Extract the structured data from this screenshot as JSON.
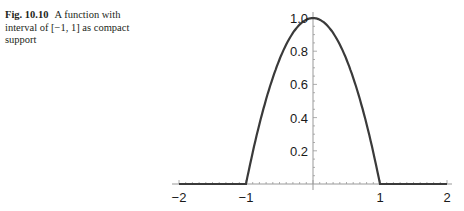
{
  "caption": {
    "label": "Fig. 10.10",
    "text": "A function with interval of [−1, 1] as compact support"
  },
  "chart_data": {
    "type": "line",
    "title": "",
    "xlabel": "",
    "ylabel": "",
    "xlim": [
      -2,
      2
    ],
    "ylim": [
      0,
      1.0
    ],
    "grid": false,
    "x_ticks": [
      "−2",
      "−1",
      "1",
      "2"
    ],
    "y_ticks": [
      "0.2",
      "0.4",
      "0.6",
      "0.8",
      "1.0"
    ],
    "series": [
      {
        "name": "f(x)",
        "x": [
          -2,
          -1,
          -0.75,
          -0.5,
          -0.25,
          0,
          0.25,
          0.5,
          0.75,
          1,
          2
        ],
        "y": [
          0,
          0,
          0.44,
          0.75,
          0.94,
          1.0,
          0.94,
          0.75,
          0.44,
          0,
          0
        ]
      }
    ]
  }
}
